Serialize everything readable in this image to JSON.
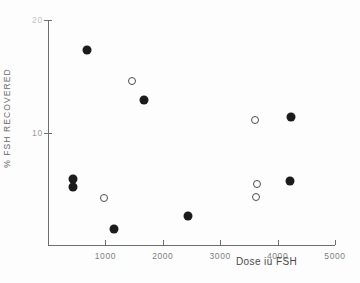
{
  "chart_data": {
    "type": "scatter",
    "title": "",
    "xlabel": "Dose iu FSH",
    "ylabel": "% FSH RECOVERED",
    "xlim": [
      0,
      5000
    ],
    "ylim": [
      0,
      20
    ],
    "grid": false,
    "legend": "none",
    "xticks": [
      {
        "value": 1000,
        "label": "1000"
      },
      {
        "value": 2000,
        "label": "2000"
      },
      {
        "value": 3000,
        "label": "3000"
      },
      {
        "value": 4000,
        "label": "4000"
      },
      {
        "value": 5000,
        "label": "5000"
      }
    ],
    "yticks": [
      {
        "value": 20,
        "label": "20",
        "faint": true
      },
      {
        "value": 10,
        "label": "10",
        "faint": false
      }
    ],
    "series": [
      {
        "name": "filled-circles",
        "marker": "filled-circle",
        "color": "#1b1b1b",
        "points": [
          {
            "x": 680,
            "y": 17.3
          },
          {
            "x": 1670,
            "y": 12.9
          },
          {
            "x": 435,
            "y": 5.9
          },
          {
            "x": 435,
            "y": 5.2
          },
          {
            "x": 1150,
            "y": 1.4
          },
          {
            "x": 2440,
            "y": 2.6
          },
          {
            "x": 4230,
            "y": 11.4
          },
          {
            "x": 4210,
            "y": 5.7
          }
        ]
      },
      {
        "name": "open-circles",
        "marker": "open-circle",
        "color": "#4d4d4d",
        "points": [
          {
            "x": 1460,
            "y": 14.6
          },
          {
            "x": 975,
            "y": 4.2
          },
          {
            "x": 3600,
            "y": 11.1
          },
          {
            "x": 3640,
            "y": 5.4
          },
          {
            "x": 3620,
            "y": 4.3
          }
        ]
      }
    ]
  }
}
